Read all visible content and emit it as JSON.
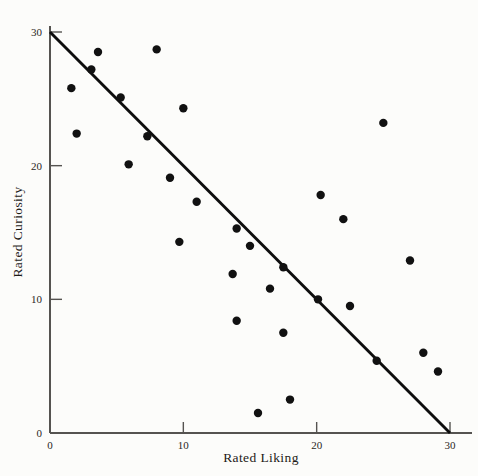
{
  "chart_data": {
    "type": "scatter",
    "title": "",
    "xlabel": "Rated Liking",
    "ylabel": "Rated Curiosity",
    "xlim": [
      0,
      30
    ],
    "ylim": [
      0,
      30
    ],
    "xticks": [
      0,
      10,
      20,
      30
    ],
    "yticks": [
      0,
      10,
      20,
      30
    ],
    "xticklabels": [
      "0",
      "10",
      "20",
      "30"
    ],
    "yticklabels": [
      "0",
      "10",
      "20",
      "30"
    ],
    "grid": false,
    "legend": null,
    "points": [
      {
        "x": 1.6,
        "y": 25.8
      },
      {
        "x": 2.0,
        "y": 22.4
      },
      {
        "x": 3.1,
        "y": 27.2
      },
      {
        "x": 3.6,
        "y": 28.5
      },
      {
        "x": 5.3,
        "y": 25.1
      },
      {
        "x": 5.9,
        "y": 20.1
      },
      {
        "x": 7.3,
        "y": 22.2
      },
      {
        "x": 8.0,
        "y": 28.7
      },
      {
        "x": 9.0,
        "y": 19.1
      },
      {
        "x": 9.7,
        "y": 14.3
      },
      {
        "x": 10.0,
        "y": 24.3
      },
      {
        "x": 11.0,
        "y": 17.3
      },
      {
        "x": 13.7,
        "y": 11.9
      },
      {
        "x": 14.0,
        "y": 15.3
      },
      {
        "x": 14.0,
        "y": 8.4
      },
      {
        "x": 15.0,
        "y": 14.0
      },
      {
        "x": 15.6,
        "y": 1.5
      },
      {
        "x": 16.5,
        "y": 10.8
      },
      {
        "x": 17.5,
        "y": 12.4
      },
      {
        "x": 17.5,
        "y": 7.5
      },
      {
        "x": 18.0,
        "y": 2.5
      },
      {
        "x": 20.1,
        "y": 10.0
      },
      {
        "x": 20.3,
        "y": 17.8
      },
      {
        "x": 22.0,
        "y": 16.0
      },
      {
        "x": 22.5,
        "y": 9.5
      },
      {
        "x": 24.5,
        "y": 5.4
      },
      {
        "x": 25.0,
        "y": 23.2
      },
      {
        "x": 27.0,
        "y": 12.9
      },
      {
        "x": 28.0,
        "y": 6.0
      },
      {
        "x": 29.1,
        "y": 4.6
      }
    ],
    "fit_line": {
      "label": "regression-line",
      "x_start": 0,
      "y_start": 30,
      "x_end": 30,
      "y_end": 0
    },
    "colors": {
      "point": "#111111",
      "line": "#0d0d0d",
      "axis": "#555350",
      "background": "#fcfcfa",
      "text": "#1d1a17"
    }
  }
}
